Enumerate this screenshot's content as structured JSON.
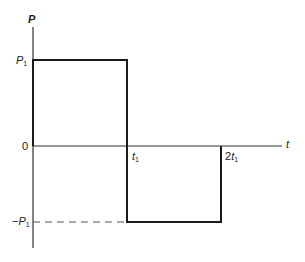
{
  "diagram": {
    "type": "square-wave pulse plot",
    "y_axis": {
      "label": "P"
    },
    "x_axis": {
      "label": "t"
    },
    "labels": {
      "p1": {
        "main": "P",
        "sub": "1"
      },
      "neg_p1": {
        "prefix": "−",
        "main": "P",
        "sub": "1"
      },
      "zero": "0",
      "t1": {
        "main": "t",
        "sub": "1"
      },
      "two_t1": {
        "prefix": "2",
        "main": "t",
        "sub": "1"
      }
    },
    "segments": [
      {
        "from_t": "0",
        "to_t": "t1",
        "value": "P1"
      },
      {
        "from_t": "t1",
        "to_t": "2t1",
        "value": "-P1"
      }
    ],
    "colors": {
      "line": "#1a1a1a",
      "axis": "#333333",
      "dash": "#555555"
    }
  }
}
